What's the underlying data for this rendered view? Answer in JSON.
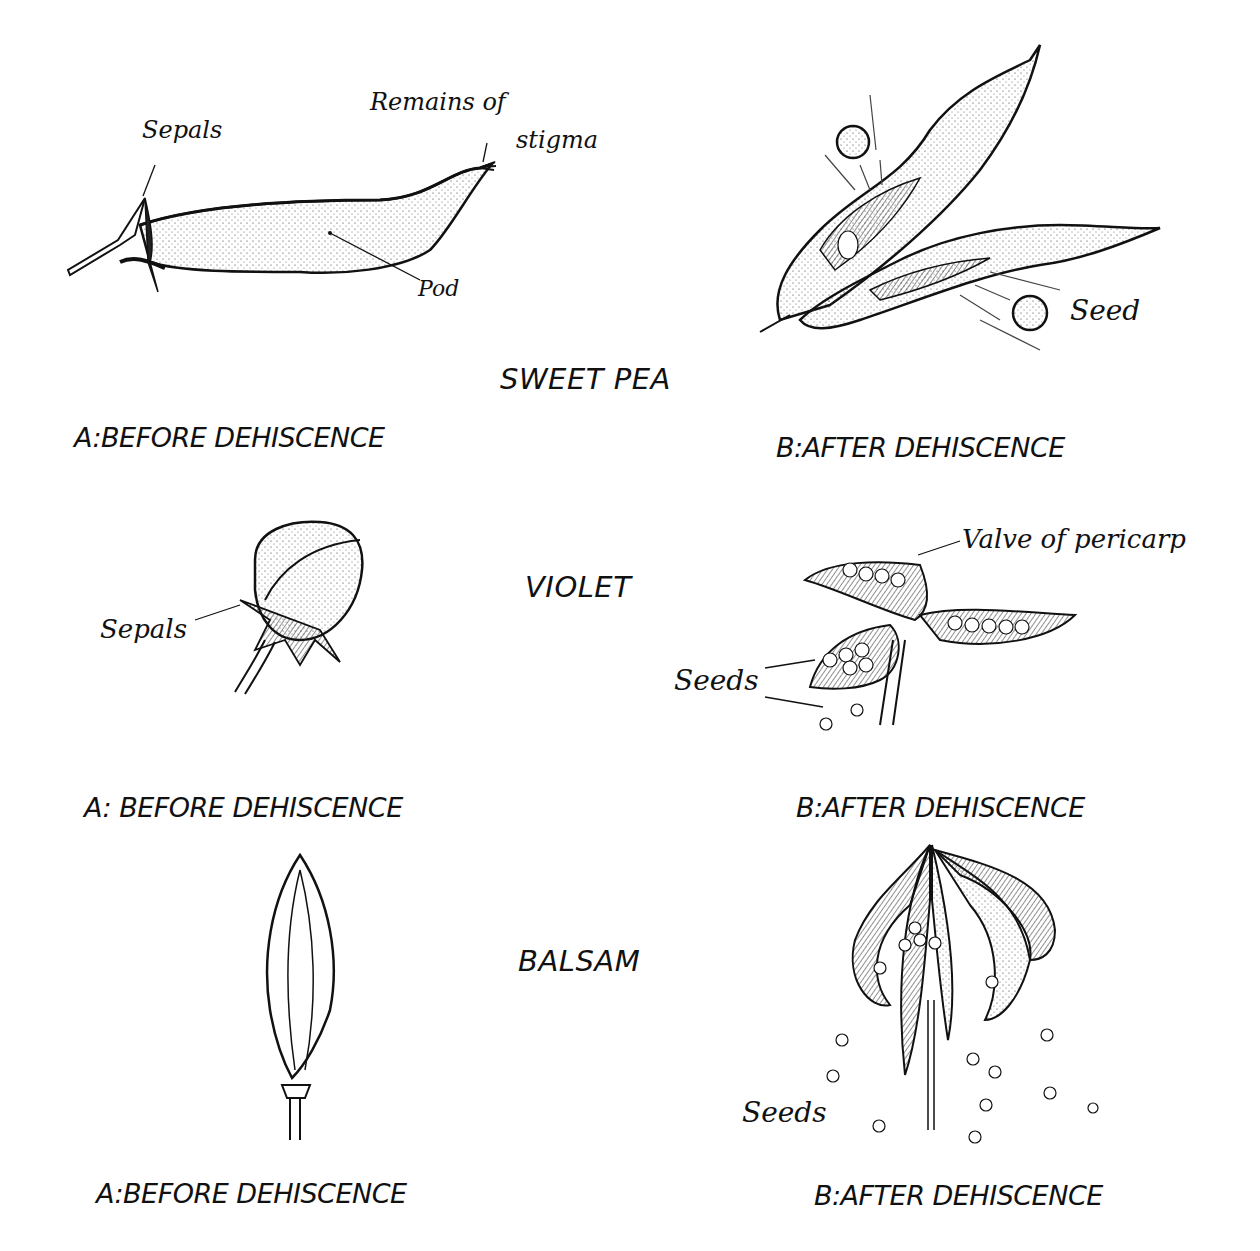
{
  "figure": {
    "rows": [
      {
        "plant": "SWEET PEA",
        "before": {
          "caption": "A:BEFORE DEHISCENCE",
          "labels": {
            "sepals": "Sepals",
            "remains_line1": "Remains of",
            "remains_line2": "stigma",
            "pod": "Pod"
          }
        },
        "after": {
          "caption": "B:AFTER DEHISCENCE",
          "labels": {
            "seed": "Seed"
          }
        }
      },
      {
        "plant": "VIOLET",
        "before": {
          "caption": "A: BEFORE DEHISCENCE",
          "labels": {
            "sepals": "Sepals"
          }
        },
        "after": {
          "caption": "B:AFTER DEHISCENCE",
          "labels": {
            "valve": "Valve of pericarp",
            "seeds": "Seeds"
          }
        }
      },
      {
        "plant": "BALSAM",
        "before": {
          "caption": "A:BEFORE DEHISCENCE",
          "labels": {}
        },
        "after": {
          "caption": "B:AFTER DEHISCENCE",
          "labels": {
            "seeds": "Seeds"
          }
        }
      }
    ]
  }
}
